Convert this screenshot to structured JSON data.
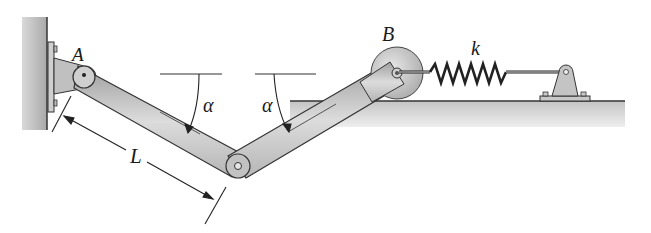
{
  "diagram": {
    "type": "mechanism",
    "labels": {
      "pin_a": "A",
      "roller_b": "B",
      "spring": "k",
      "angle_left": "α",
      "angle_right": "α",
      "length": "L"
    },
    "components": [
      {
        "name": "wall",
        "description": "fixed wall with bracket at A"
      },
      {
        "name": "link-AC",
        "description": "bar from pin A down to middle pin"
      },
      {
        "name": "link-CB",
        "description": "bar from middle pin up to roller B"
      },
      {
        "name": "roller-B",
        "description": "wheel rolling on horizontal floor"
      },
      {
        "name": "spring",
        "description": "spring of stiffness k connecting B to fixed bracket"
      },
      {
        "name": "floor",
        "description": "horizontal ground surface"
      }
    ],
    "colors": {
      "bar_fill": "#c8c8c8",
      "bar_stroke": "#3a3a3a",
      "wall_fill": "#bdbdbd",
      "floor_fill": "#d6d6d6",
      "text": "#1a1a1a"
    }
  }
}
